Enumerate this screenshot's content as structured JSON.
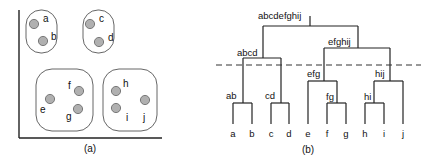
{
  "figure": {
    "panel_a": {
      "caption": "(a)",
      "clusters": [
        {
          "id": "ab",
          "points": [
            {
              "label": "a",
              "cx": 34,
              "cy": 24,
              "lx": 43,
              "ly": 22
            },
            {
              "label": "b",
              "cx": 43,
              "cy": 41,
              "lx": 51,
              "ly": 40
            }
          ],
          "box": {
            "x": 26,
            "y": 10,
            "w": 31,
            "h": 43,
            "r": 15
          }
        },
        {
          "id": "cd",
          "points": [
            {
              "label": "c",
              "cx": 90,
              "cy": 24,
              "lx": 99,
              "ly": 22
            },
            {
              "label": "d",
              "cx": 99,
              "cy": 42,
              "lx": 108,
              "ly": 41
            }
          ],
          "box": {
            "x": 83,
            "y": 10,
            "w": 31,
            "h": 43,
            "r": 15
          }
        },
        {
          "id": "efg",
          "points": [
            {
              "label": "e",
              "cx": 50,
              "cy": 99,
              "lx": 40,
              "ly": 113
            },
            {
              "label": "f",
              "cx": 79,
              "cy": 91,
              "lx": 68,
              "ly": 89
            },
            {
              "label": "g",
              "cx": 78,
              "cy": 109,
              "lx": 66,
              "ly": 120
            }
          ],
          "box": {
            "x": 36,
            "y": 69,
            "w": 57,
            "h": 62,
            "r": 16
          }
        },
        {
          "id": "hij",
          "points": [
            {
              "label": "h",
              "cx": 116,
              "cy": 91,
              "lx": 123,
              "ly": 87
            },
            {
              "label": "i",
              "cx": 116,
              "cy": 108,
              "lx": 126,
              "ly": 121
            },
            {
              "label": "j",
              "cx": 145,
              "cy": 100,
              "lx": 143,
              "ly": 121
            }
          ],
          "box": {
            "x": 103,
            "y": 69,
            "w": 54,
            "h": 62,
            "r": 16
          }
        }
      ]
    },
    "panel_b": {
      "caption": "(b)",
      "leaves": [
        "a",
        "b",
        "c",
        "d",
        "e",
        "f",
        "g",
        "h",
        "i",
        "j"
      ],
      "internal_nodes": [
        {
          "label": "ab",
          "members": [
            "a",
            "b"
          ]
        },
        {
          "label": "cd",
          "members": [
            "c",
            "d"
          ]
        },
        {
          "label": "fg",
          "members": [
            "f",
            "g"
          ]
        },
        {
          "label": "hi",
          "members": [
            "h",
            "i"
          ]
        },
        {
          "label": "efg",
          "members": [
            "e",
            "fg"
          ]
        },
        {
          "label": "hij",
          "members": [
            "hi",
            "j"
          ]
        },
        {
          "label": "abcd",
          "members": [
            "ab",
            "cd"
          ]
        },
        {
          "label": "efghij",
          "members": [
            "efg",
            "hij"
          ]
        },
        {
          "label": "abcdefghij",
          "members": [
            "abcd",
            "efghij"
          ]
        }
      ],
      "cut_line": "dashed"
    }
  },
  "colors": {
    "ink": "#222222",
    "point_fill": "#b0b0b0",
    "point_stroke": "#6e6e6e",
    "cluster_stroke": "#555555"
  }
}
